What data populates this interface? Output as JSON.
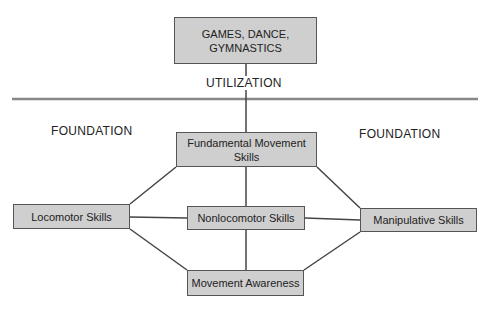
{
  "diagram": {
    "colors": {
      "box_fill": "#cfcfcf",
      "box_border": "#555555",
      "line": "#444444",
      "divider": "#888888"
    },
    "top_box": {
      "line1": "GAMES, DANCE,",
      "line2": "GYMNASTICS"
    },
    "utilization_label": "UTILIZATION",
    "foundation_left": "FOUNDATION",
    "foundation_right": "FOUNDATION",
    "fms_box": {
      "line1": "Fundamental Movement",
      "line2": "Skills"
    },
    "locomotor_box": "Locomotor Skills",
    "nonlocomotor_box": "Nonlocomotor Skills",
    "manipulative_box": "Manipulative Skills",
    "awareness_box": "Movement Awareness"
  }
}
